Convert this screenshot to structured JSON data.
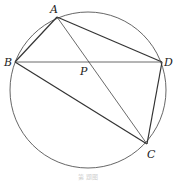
{
  "diagram": {
    "type": "geometry",
    "circle": {
      "cx": 88,
      "cy": 90,
      "r": 78
    },
    "points": {
      "A": {
        "label": "A",
        "x": 57,
        "y": 17
      },
      "B": {
        "label": "B",
        "x": 15,
        "y": 62
      },
      "C": {
        "label": "C",
        "x": 147,
        "y": 144
      },
      "D": {
        "label": "D",
        "x": 162,
        "y": 62
      },
      "P": {
        "label": "P",
        "x": 85,
        "y": 62
      }
    },
    "segments": [
      "AB",
      "AD",
      "BC",
      "CD",
      "BD",
      "AC"
    ],
    "caption": "第 题图",
    "colors": {
      "stroke": "#333333",
      "circle": "#555555",
      "background": "#ffffff"
    }
  }
}
